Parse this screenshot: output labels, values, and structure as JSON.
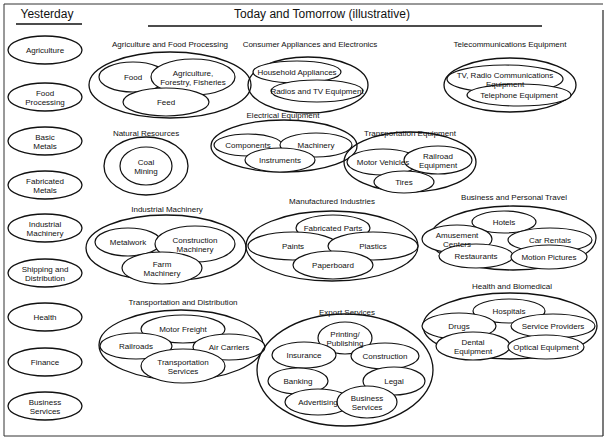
{
  "headers": {
    "yesterday": "Yesterday",
    "today": "Today and Tomorrow (illustrative)"
  },
  "yesterday_items": [
    {
      "lines": [
        "Agriculture"
      ],
      "cx": 45,
      "cy": 50
    },
    {
      "lines": [
        "Food",
        "Processing"
      ],
      "cx": 45,
      "cy": 97
    },
    {
      "lines": [
        "Basic",
        "Metals"
      ],
      "cx": 45,
      "cy": 141
    },
    {
      "lines": [
        "Fabricated",
        "Metals"
      ],
      "cx": 45,
      "cy": 185
    },
    {
      "lines": [
        "Industrial",
        "Machinery"
      ],
      "cx": 45,
      "cy": 228
    },
    {
      "lines": [
        "Shipping and",
        "Distribution"
      ],
      "cx": 45,
      "cy": 273
    },
    {
      "lines": [
        "Health"
      ],
      "cx": 45,
      "cy": 317
    },
    {
      "lines": [
        "Finance"
      ],
      "cx": 45,
      "cy": 362
    },
    {
      "lines": [
        "Business",
        "Services"
      ],
      "cx": 45,
      "cy": 406
    }
  ],
  "groups": [
    {
      "title": "Agriculture and Food Processing",
      "tx": 170,
      "ty": 47,
      "outer": {
        "cx": 170,
        "cy": 85,
        "rx": 81,
        "ry": 33
      },
      "items": [
        {
          "lines": [
            "Food"
          ],
          "cx": 133,
          "cy": 77,
          "rx": 34,
          "ry": 15
        },
        {
          "lines": [
            "Agriculture,",
            "Forestry, Fisheries"
          ],
          "cx": 193,
          "cy": 77,
          "rx": 42,
          "ry": 18
        },
        {
          "lines": [
            "Feed"
          ],
          "cx": 166,
          "cy": 102,
          "rx": 43,
          "ry": 14
        }
      ]
    },
    {
      "title": "Consumer Appliances and Electronics",
      "tx": 310,
      "ty": 47,
      "outer": {
        "cx": 308,
        "cy": 85,
        "rx": 60,
        "ry": 28
      },
      "items": [
        {
          "lines": [
            "Household Appliances"
          ],
          "cx": 297,
          "cy": 72,
          "rx": 44,
          "ry": 11
        },
        {
          "lines": [
            "Radios and TV Equipment"
          ],
          "cx": 317,
          "cy": 91,
          "rx": 46,
          "ry": 11
        }
      ]
    },
    {
      "title": "Telecommunications Equipment",
      "tx": 510,
      "ty": 47,
      "outer": {
        "cx": 510,
        "cy": 85,
        "rx": 66,
        "ry": 27
      },
      "items": [
        {
          "lines": [
            "TV, Radio Communications",
            "Equipment"
          ],
          "cx": 505,
          "cy": 79,
          "rx": 58,
          "ry": 14
        },
        {
          "lines": [
            "Telephone Equipment"
          ],
          "cx": 519,
          "cy": 95,
          "rx": 52,
          "ry": 11
        }
      ]
    },
    {
      "title": "Natural Resources",
      "tx": 146,
      "ty": 136,
      "outer": {
        "cx": 146,
        "cy": 166,
        "rx": 42,
        "ry": 29
      },
      "items": [
        {
          "lines": [
            "Coal",
            "Mining"
          ],
          "cx": 146,
          "cy": 166,
          "rx": 26,
          "ry": 19
        }
      ]
    },
    {
      "title": "Electrical Equipment",
      "tx": 283,
      "ty": 118,
      "outer": {
        "cx": 284,
        "cy": 146,
        "rx": 73,
        "ry": 26
      },
      "items": [
        {
          "lines": [
            "Components"
          ],
          "cx": 248,
          "cy": 145,
          "rx": 34,
          "ry": 11
        },
        {
          "lines": [
            "Machinery"
          ],
          "cx": 316,
          "cy": 145,
          "rx": 36,
          "ry": 12
        },
        {
          "lines": [
            "Instruments"
          ],
          "cx": 280,
          "cy": 160,
          "rx": 35,
          "ry": 12
        }
      ]
    },
    {
      "title": "Transportation Equipment",
      "tx": 410,
      "ty": 136,
      "outer": {
        "cx": 410,
        "cy": 162,
        "rx": 66,
        "ry": 30
      },
      "items": [
        {
          "lines": [
            "Motor Vehicles"
          ],
          "cx": 383,
          "cy": 162,
          "rx": 36,
          "ry": 13
        },
        {
          "lines": [
            "Railroad",
            "Equipment"
          ],
          "cx": 438,
          "cy": 160,
          "rx": 34,
          "ry": 14
        },
        {
          "lines": [
            "Tires"
          ],
          "cx": 404,
          "cy": 182,
          "rx": 30,
          "ry": 11
        }
      ]
    },
    {
      "title": "Industrial Machinery",
      "tx": 167,
      "ty": 212,
      "outer": {
        "cx": 166,
        "cy": 248,
        "rx": 80,
        "ry": 33
      },
      "items": [
        {
          "lines": [
            "Metalwork"
          ],
          "cx": 128,
          "cy": 242,
          "rx": 33,
          "ry": 14
        },
        {
          "lines": [
            "Construction",
            "Machinery"
          ],
          "cx": 195,
          "cy": 244,
          "rx": 40,
          "ry": 18
        },
        {
          "lines": [
            "Farm",
            "Machinery"
          ],
          "cx": 162,
          "cy": 268,
          "rx": 40,
          "ry": 16
        }
      ]
    },
    {
      "title": "Manufactured Industries",
      "tx": 332,
      "ty": 204,
      "outer": {
        "cx": 332,
        "cy": 246,
        "rx": 86,
        "ry": 35
      },
      "items": [
        {
          "lines": [
            "Fabricated Parts"
          ],
          "cx": 333,
          "cy": 228,
          "rx": 37,
          "ry": 13
        },
        {
          "lines": [
            "Paints"
          ],
          "cx": 293,
          "cy": 246,
          "rx": 45,
          "ry": 14
        },
        {
          "lines": [
            "Plastics"
          ],
          "cx": 373,
          "cy": 246,
          "rx": 45,
          "ry": 14
        },
        {
          "lines": [
            "Paperboard"
          ],
          "cx": 333,
          "cy": 265,
          "rx": 40,
          "ry": 14
        }
      ]
    },
    {
      "title": "Business and Personal Travel",
      "tx": 514,
      "ty": 200,
      "outer": {
        "cx": 513,
        "cy": 238,
        "rx": 83,
        "ry": 32
      },
      "items": [
        {
          "lines": [
            "Hotels"
          ],
          "cx": 504,
          "cy": 222,
          "rx": 32,
          "ry": 11
        },
        {
          "lines": [
            "Amusement",
            "Centers"
          ],
          "cx": 457,
          "cy": 239,
          "rx": 35,
          "ry": 14
        },
        {
          "lines": [
            "Car Rentals"
          ],
          "cx": 550,
          "cy": 240,
          "rx": 42,
          "ry": 12
        },
        {
          "lines": [
            "Restaurants"
          ],
          "cx": 476,
          "cy": 256,
          "rx": 37,
          "ry": 12
        },
        {
          "lines": [
            "Motion Pictures"
          ],
          "cx": 549,
          "cy": 257,
          "rx": 38,
          "ry": 12
        }
      ]
    },
    {
      "title": "Health and Biomedical",
      "tx": 512,
      "ty": 289,
      "outer": {
        "cx": 510,
        "cy": 326,
        "rx": 87,
        "ry": 33
      },
      "items": [
        {
          "lines": [
            "Hospitals"
          ],
          "cx": 509,
          "cy": 311,
          "rx": 36,
          "ry": 12
        },
        {
          "lines": [
            "Drugs"
          ],
          "cx": 459,
          "cy": 326,
          "rx": 37,
          "ry": 13
        },
        {
          "lines": [
            "Service Providers"
          ],
          "cx": 553,
          "cy": 326,
          "rx": 42,
          "ry": 12
        },
        {
          "lines": [
            "Dental",
            "Equipment"
          ],
          "cx": 473,
          "cy": 346,
          "rx": 37,
          "ry": 14
        },
        {
          "lines": [
            "Optical Equipment"
          ],
          "cx": 546,
          "cy": 347,
          "rx": 38,
          "ry": 12
        }
      ]
    },
    {
      "title": "Transportation and Distribution",
      "tx": 183,
      "ty": 305,
      "outer": {
        "cx": 181,
        "cy": 345,
        "rx": 82,
        "ry": 35
      },
      "items": [
        {
          "lines": [
            "Motor Freight"
          ],
          "cx": 183,
          "cy": 329,
          "rx": 42,
          "ry": 14
        },
        {
          "lines": [
            "Railroads"
          ],
          "cx": 136,
          "cy": 346,
          "rx": 36,
          "ry": 13
        },
        {
          "lines": [
            "Air Carriers"
          ],
          "cx": 229,
          "cy": 347,
          "rx": 36,
          "ry": 13
        },
        {
          "lines": [
            "Transportation",
            "Services"
          ],
          "cx": 183,
          "cy": 366,
          "rx": 42,
          "ry": 17
        }
      ]
    },
    {
      "title": "Export Services",
      "tx": 347,
      "ty": 315,
      "outer": {
        "cx": 345,
        "cy": 370,
        "rx": 88,
        "ry": 56
      },
      "items": [
        {
          "lines": [
            "Printing/",
            "Publishing"
          ],
          "cx": 345,
          "cy": 338,
          "rx": 27,
          "ry": 16
        },
        {
          "lines": [
            "Insurance"
          ],
          "cx": 304,
          "cy": 355,
          "rx": 32,
          "ry": 13
        },
        {
          "lines": [
            "Construction"
          ],
          "cx": 385,
          "cy": 356,
          "rx": 34,
          "ry": 13
        },
        {
          "lines": [
            "Banking"
          ],
          "cx": 298,
          "cy": 381,
          "rx": 30,
          "ry": 13
        },
        {
          "lines": [
            "Legal"
          ],
          "cx": 394,
          "cy": 381,
          "rx": 31,
          "ry": 14
        },
        {
          "lines": [
            "Advertising"
          ],
          "cx": 318,
          "cy": 402,
          "rx": 33,
          "ry": 13
        },
        {
          "lines": [
            "Business",
            "Services"
          ],
          "cx": 367,
          "cy": 402,
          "rx": 30,
          "ry": 16
        }
      ]
    }
  ]
}
